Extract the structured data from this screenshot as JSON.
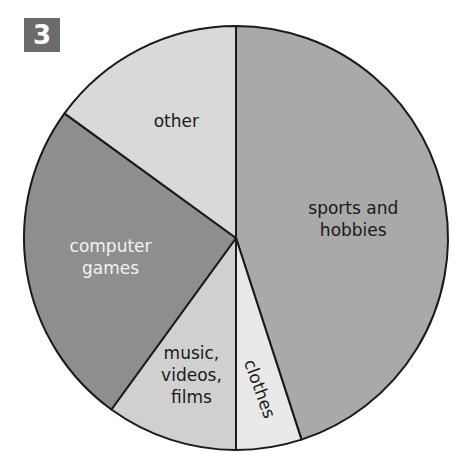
{
  "figure_number": "3",
  "chart_data": {
    "type": "pie",
    "title": "",
    "start": "top",
    "direction": "clockwise",
    "slices": [
      {
        "label": "sports and hobbies",
        "lines": [
          "sports and",
          "hobbies"
        ],
        "value": 45,
        "color": "#a9a9a9",
        "text_color": "#1a1a1a"
      },
      {
        "label": "clothes",
        "lines": [
          "clothes"
        ],
        "value": 5,
        "color": "#e9e9e9",
        "text_color": "#1a1a1a"
      },
      {
        "label": "music, videos, films",
        "lines": [
          "music,",
          "videos,",
          "films"
        ],
        "value": 10,
        "color": "#d0d0d0",
        "text_color": "#1a1a1a"
      },
      {
        "label": "computer games",
        "lines": [
          "computer",
          "games"
        ],
        "value": 25,
        "color": "#8e8e8e",
        "text_color": "#f2f2f2"
      },
      {
        "label": "other",
        "lines": [
          "other"
        ],
        "value": 15,
        "color": "#d9d9d9",
        "text_color": "#1a1a1a"
      }
    ]
  }
}
